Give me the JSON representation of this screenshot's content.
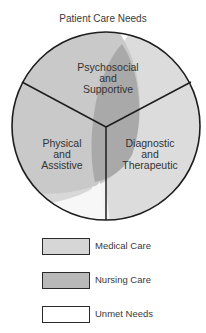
{
  "title": "Patient Care Needs",
  "segments": [
    {
      "id": "psychosocial",
      "line1": "Psychosocial",
      "line2": "and",
      "line3": "Supportive"
    },
    {
      "id": "physical",
      "line1": "Physical",
      "line2": "and",
      "line3": "Assistive"
    },
    {
      "id": "diagnostic",
      "line1": "Diagnostic",
      "line2": "and",
      "line3": "Therapeutic"
    }
  ],
  "legend": [
    {
      "label": "Medical Care",
      "color": "#d6d6d6"
    },
    {
      "label": "Nursing Care",
      "color": "#b9b9b9"
    },
    {
      "label": "Unmet Needs",
      "color": "#ffffff"
    }
  ],
  "colors": {
    "medical": "#d6d6d6",
    "nursing": "#b9b9b9",
    "overlap": "#a8a8a8",
    "unmet": "#f4f4f4",
    "outline": "#222222"
  }
}
